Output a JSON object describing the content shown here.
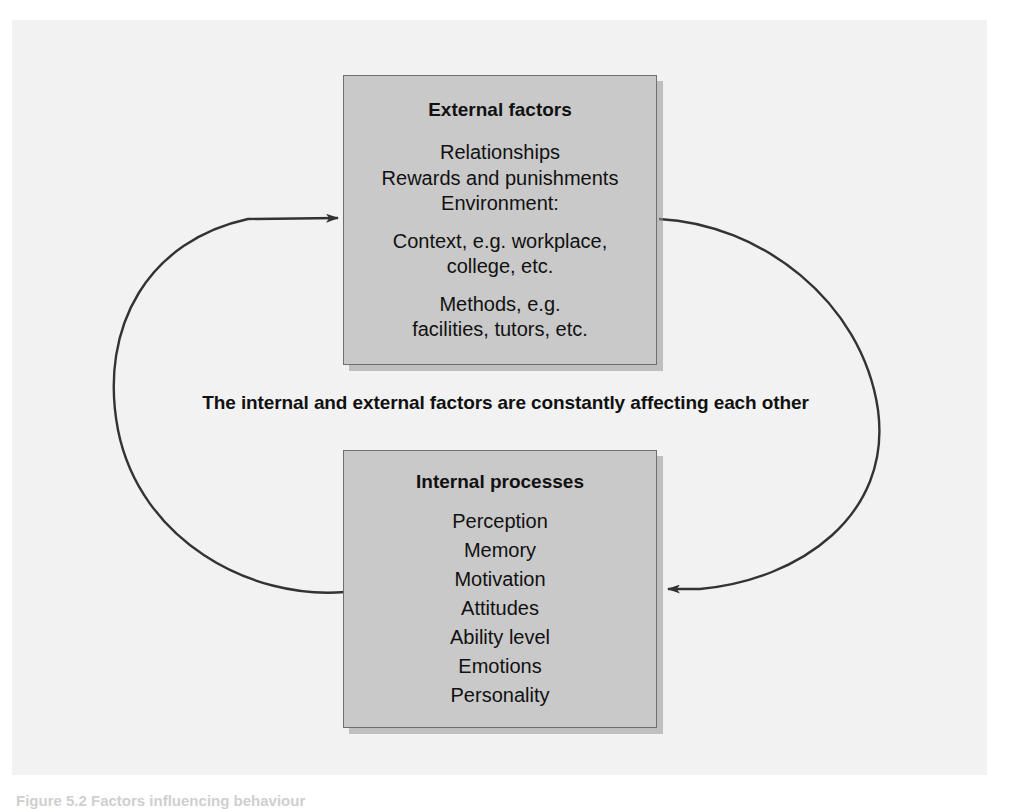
{
  "figure": {
    "background_color": "#f2f2f2",
    "box_fill_color": "#c9c9c9",
    "box_border_color": "#6f6f6f",
    "arrow_color": "#333333",
    "text_color": "#111111"
  },
  "external_box": {
    "title": "External factors",
    "lines": [
      "Relationships",
      "Rewards and punishments",
      "Environment:",
      "Context, e.g. workplace,",
      "college, etc.",
      "Methods, e.g.",
      "facilities, tutors, etc."
    ]
  },
  "internal_box": {
    "title": "Internal processes",
    "lines": [
      "Perception",
      "Memory",
      "Motivation",
      "Attitudes",
      "Ability level",
      "Emotions",
      "Personality"
    ]
  },
  "centre_caption": {
    "text": "The internal and external factors are constantly affecting each other"
  },
  "bottom_caption": {
    "text": "Figure 5.2  Factors influencing behaviour"
  },
  "arrows": [
    {
      "name": "internal-to-external-arrow",
      "direction": "counter-clockwise left loop",
      "from": "Internal processes (bottom-left)",
      "to": "External factors (left edge)"
    },
    {
      "name": "external-to-internal-arrow",
      "direction": "clockwise right loop",
      "from": "External factors (right edge)",
      "to": "Internal processes (right edge)"
    }
  ]
}
